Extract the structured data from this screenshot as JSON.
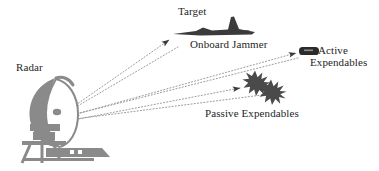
{
  "diagram": {
    "background_color": "#ffffff",
    "labels": {
      "target": "Target",
      "onboard_jammer": "Onboard Jammer",
      "radar": "Radar",
      "active_expendables_line1": "Active",
      "active_expendables_line2": "Expendables",
      "passive_expendables": "Passive Expendables"
    },
    "colors": {
      "radar_gray": "#8a8a8a",
      "aircraft_dark": "#3b3b3b",
      "starburst_dark": "#4a4a4a",
      "pod_dark": "#2b2b2b",
      "line_gray": "#9a9a9a",
      "arrow_dark": "#3a3a3a",
      "text": "#262626"
    },
    "nodes": [
      {
        "id": "radar",
        "name": "radar-dish",
        "x": 55,
        "y": 112
      },
      {
        "id": "target",
        "name": "target-aircraft",
        "x": 205,
        "y": 30
      },
      {
        "id": "active-expendables",
        "name": "active-expendable-pod",
        "x": 310,
        "y": 52
      },
      {
        "id": "passive-expendables",
        "name": "passive-expendable-chaff",
        "x": 255,
        "y": 82
      }
    ],
    "links": [
      {
        "name": "radar-to-target-path",
        "from": "radar",
        "to": "target",
        "style": "dotted",
        "arrow": "forward"
      },
      {
        "name": "radar-to-active-path",
        "from": "radar",
        "to": "active-expendables",
        "style": "dotted",
        "arrow": "forward"
      },
      {
        "name": "radar-to-passive-path",
        "from": "radar",
        "to": "passive-expendables",
        "style": "dotted",
        "arrow": "forward"
      },
      {
        "name": "target-to-radar-return",
        "from": "target",
        "to": "radar",
        "style": "dotted",
        "arrow": "forward"
      },
      {
        "name": "active-to-radar-return",
        "from": "active-expendables",
        "to": "radar",
        "style": "dotted",
        "arrow": "forward"
      },
      {
        "name": "passive-to-radar-return",
        "from": "passive-expendables",
        "to": "radar",
        "style": "dotted",
        "arrow": "forward"
      }
    ]
  }
}
